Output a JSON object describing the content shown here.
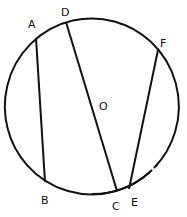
{
  "diagram": {
    "type": "circle-chords",
    "circle": {
      "center_label": "O",
      "cx": 92,
      "cy": 106,
      "rx": 87,
      "ry": 88
    },
    "points": [
      {
        "id": "A",
        "label": "A",
        "x": 36,
        "y": 38,
        "lx": 28,
        "ly": 28
      },
      {
        "id": "D",
        "label": "D",
        "x": 66,
        "y": 22,
        "lx": 61,
        "ly": 16
      },
      {
        "id": "F",
        "label": "F",
        "x": 158,
        "y": 50,
        "lx": 160,
        "ly": 47
      },
      {
        "id": "B",
        "label": "B",
        "x": 45,
        "y": 182,
        "lx": 41,
        "ly": 204
      },
      {
        "id": "C",
        "label": "C",
        "x": 117,
        "y": 191,
        "lx": 112,
        "ly": 210
      },
      {
        "id": "E",
        "label": "E",
        "x": 129,
        "y": 189,
        "lx": 131,
        "ly": 206
      }
    ],
    "center": {
      "label": "O",
      "x": 104,
      "y": 106
    },
    "segments": [
      {
        "from": "A",
        "to": "B"
      },
      {
        "from": "D",
        "to": "C"
      },
      {
        "from": "F",
        "to": "E"
      }
    ],
    "colors": {
      "stroke": "#111111",
      "background": "#ffffff"
    }
  }
}
